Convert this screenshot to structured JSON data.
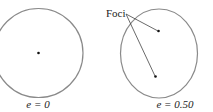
{
  "diagram": {
    "left": {
      "caption": "e = 0",
      "shape": "circle"
    },
    "right": {
      "caption": "e = 0.50",
      "shape": "ellipse",
      "annotation": "Foci"
    },
    "colors": {
      "outline": "#8a8a8a",
      "point": "#111111",
      "leader": "#444444",
      "text": "#222222"
    }
  }
}
